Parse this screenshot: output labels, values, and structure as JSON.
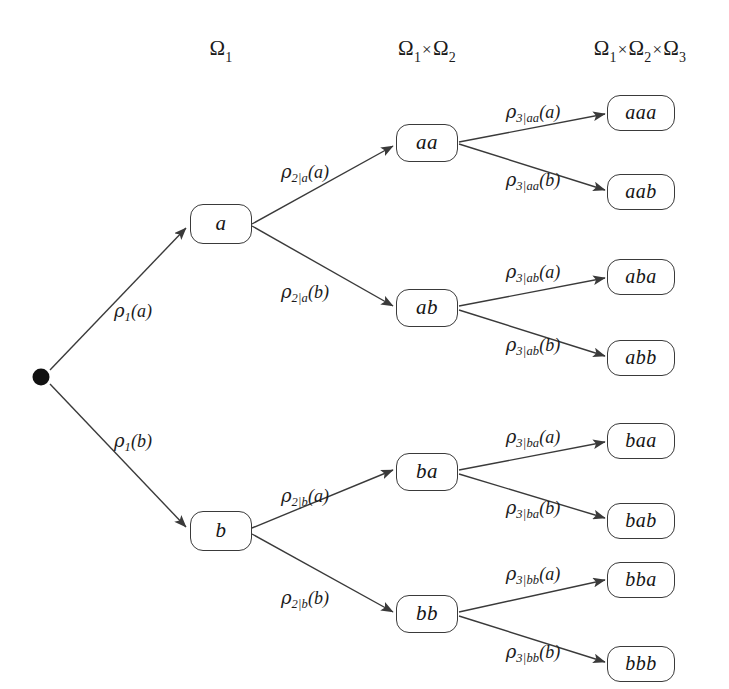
{
  "diagram": {
    "background_color": "#ffffff",
    "stroke_color": "#3a3a3a",
    "text_color": "#1b1b1b",
    "root_color": "#111111"
  },
  "headers": [
    {
      "id": "header-omega1",
      "text": "Ω₁",
      "omega_parts": [
        "1"
      ]
    },
    {
      "id": "header-omega1x2",
      "text": "Ω₁×Ω₂",
      "omega_parts": [
        "1",
        "2"
      ]
    },
    {
      "id": "header-omega1x2x3",
      "text": "Ω₁×Ω₂×Ω₃",
      "omega_parts": [
        "1",
        "2",
        "3"
      ]
    }
  ],
  "root": {
    "id": "root",
    "label": ""
  },
  "nodes": {
    "level1": [
      {
        "id": "node-a",
        "label": "a"
      },
      {
        "id": "node-b",
        "label": "b"
      }
    ],
    "level2": [
      {
        "id": "node-aa",
        "label": "aa"
      },
      {
        "id": "node-ab",
        "label": "ab"
      },
      {
        "id": "node-ba",
        "label": "ba"
      },
      {
        "id": "node-bb",
        "label": "bb"
      }
    ],
    "level3": [
      {
        "id": "node-aaa",
        "label": "aaa"
      },
      {
        "id": "node-aab",
        "label": "aab"
      },
      {
        "id": "node-aba",
        "label": "aba"
      },
      {
        "id": "node-abb",
        "label": "abb"
      },
      {
        "id": "node-baa",
        "label": "baa"
      },
      {
        "id": "node-bab",
        "label": "bab"
      },
      {
        "id": "node-bba",
        "label": "bba"
      },
      {
        "id": "node-bbb",
        "label": "bbb"
      }
    ]
  },
  "edge_labels": {
    "e1a": {
      "rho": "ρ",
      "sub": "1",
      "arg": "(a)",
      "full": "ρ₁(a)"
    },
    "e1b": {
      "rho": "ρ",
      "sub": "1",
      "arg": "(b)",
      "full": "ρ₁(b)"
    },
    "e2aa": {
      "rho": "ρ",
      "sub": "2|a",
      "arg": "(a)",
      "full": "ρ₂|ₐ(a)"
    },
    "e2ab": {
      "rho": "ρ",
      "sub": "2|a",
      "arg": "(b)",
      "full": "ρ₂|ₐ(b)"
    },
    "e2ba": {
      "rho": "ρ",
      "sub": "2|b",
      "arg": "(a)",
      "full": "ρ₂|ᵇ(a)"
    },
    "e2bb": {
      "rho": "ρ",
      "sub": "2|b",
      "arg": "(b)",
      "full": "ρ₂|ᵇ(b)"
    },
    "e3aaa": {
      "rho": "ρ",
      "sub": "3|aa",
      "arg": "(a)",
      "full": "ρ₃|ₐₐ(a)"
    },
    "e3aab": {
      "rho": "ρ",
      "sub": "3|aa",
      "arg": "(b)",
      "full": "ρ₃|ₐₐ(b)"
    },
    "e3aba": {
      "rho": "ρ",
      "sub": "3|ab",
      "arg": "(a)",
      "full": "ρ₃|ₐᵇ(a)"
    },
    "e3abb": {
      "rho": "ρ",
      "sub": "3|ab",
      "arg": "(b)",
      "full": "ρ₃|ₐᵇ(b)"
    },
    "e3baa": {
      "rho": "ρ",
      "sub": "3|ba",
      "arg": "(a)",
      "full": "ρ₃|ᵇₐ(a)"
    },
    "e3bab": {
      "rho": "ρ",
      "sub": "3|ba",
      "arg": "(b)",
      "full": "ρ₃|ᵇₐ(b)"
    },
    "e3bba": {
      "rho": "ρ",
      "sub": "3|bb",
      "arg": "(a)",
      "full": "ρ₃|ᵇᵇ(a)"
    },
    "e3bbb": {
      "rho": "ρ",
      "sub": "3|bb",
      "arg": "(b)",
      "full": "ρ₃|ᵇᵇ(b)"
    }
  }
}
